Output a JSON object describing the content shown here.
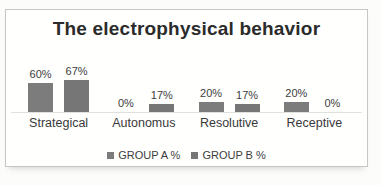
{
  "chart_data": {
    "type": "bar",
    "title": "The electrophysical behavior",
    "categories": [
      "Strategical",
      "Autonomus",
      "Resolutive",
      "Receptive"
    ],
    "series": [
      {
        "name": "GROUP A %",
        "values": [
          60,
          0,
          20,
          20
        ],
        "color": "#7c7c7c"
      },
      {
        "name": "GROUP B %",
        "values": [
          67,
          17,
          17,
          0
        ],
        "color": "#767676"
      }
    ],
    "value_suffix": "%",
    "data_labels": true,
    "xlabel": "",
    "ylabel": "",
    "ylim": [
      0,
      100
    ],
    "grid": false,
    "legend_position": "bottom",
    "axis_line_color": "#e0e0dd",
    "frame_border_color": "#c6c6c2",
    "title_color": "#2b2b2b",
    "label_color": "#3d3d3d"
  }
}
